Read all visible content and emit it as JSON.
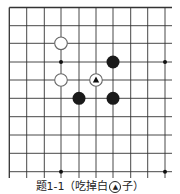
{
  "diagram": {
    "type": "go-board-problem",
    "grid": {
      "x_lines": [
        9.3,
        26.7,
        44.3,
        61,
        79,
        96,
        113,
        130.7,
        147.7,
        165
      ],
      "y_lines": [
        7.5,
        25.7,
        43.3,
        62,
        80,
        98.3,
        116.7,
        135,
        153.3,
        171.7
      ],
      "left_edge": true,
      "top_edge": true,
      "right_open": true,
      "bottom_open": true,
      "line_color": "#333333"
    },
    "hoshi": [
      {
        "col": 3,
        "row": 3
      },
      {
        "col": 9,
        "row": 3
      },
      {
        "col": 3,
        "row": 9
      },
      {
        "col": 9,
        "row": 9
      }
    ],
    "stones": [
      {
        "color": "white",
        "col": 3,
        "row": 2,
        "mark": ""
      },
      {
        "color": "black",
        "col": 6,
        "row": 3,
        "mark": ""
      },
      {
        "color": "white",
        "col": 3,
        "row": 4,
        "mark": ""
      },
      {
        "color": "white",
        "col": 5,
        "row": 4,
        "mark": "triangle"
      },
      {
        "color": "black",
        "col": 4,
        "row": 5,
        "mark": ""
      },
      {
        "color": "black",
        "col": 6,
        "row": 5,
        "mark": ""
      }
    ]
  },
  "caption": {
    "prefix": "题1-1（吃掉白",
    "mark_symbol": "▲",
    "suffix": "子）"
  }
}
